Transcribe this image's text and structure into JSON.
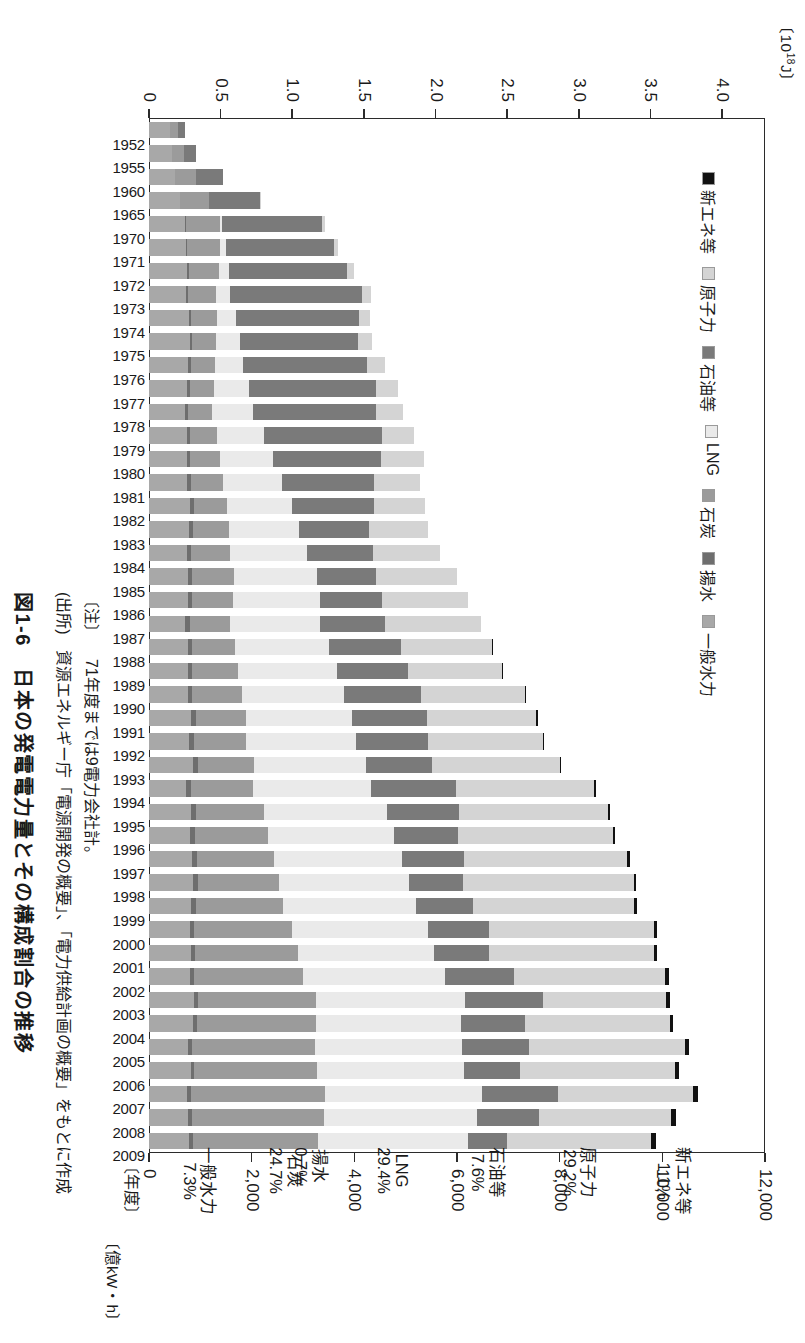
{
  "figure": {
    "title": "図1-6　日本の発電電力量とその構成割合の推移",
    "note_label": "〔注〕",
    "note_text": "71年度までは9電力会社計。",
    "source_label": "(出所)",
    "source_text": "資源エネルギー庁「電源開発の概要」、「電力供給計画の概要」をもとに作成",
    "xaxis_label": "〔年度〕"
  },
  "chart_data": {
    "type": "bar",
    "subtype": "stacked-horizontal",
    "title": "日本の発電電力量とその構成割合の推移",
    "xlabel": "〔年度〕",
    "ylabel_primary": "〔10¹⁸J〕",
    "ylabel_secondary": "〔億kW・h〕",
    "grid": false,
    "legend_position": "bottom-left",
    "primary_axis": {
      "unit": "10^18 J",
      "ticks": [
        "4.0",
        "3.5",
        "3.0",
        "2.5",
        "2.0",
        "1.5",
        "1.0",
        "0.5",
        "0"
      ],
      "range": [
        0,
        4.3
      ]
    },
    "secondary_axis": {
      "unit": "億kW・h",
      "ticks": [
        "12,000",
        "10,000",
        "8,000",
        "6,000",
        "4,000",
        "2,000",
        "0"
      ],
      "range": [
        0,
        12000
      ]
    },
    "categories": [
      "1952",
      "1955",
      "1960",
      "1965",
      "1970",
      "1971",
      "1972",
      "1973",
      "1974",
      "1975",
      "1976",
      "1977",
      "1978",
      "1979",
      "1980",
      "1981",
      "1982",
      "1983",
      "1984",
      "1985",
      "1986",
      "1987",
      "1988",
      "1989",
      "1990",
      "1991",
      "1992",
      "1993",
      "1994",
      "1995",
      "1996",
      "1997",
      "1998",
      "1999",
      "2000",
      "2001",
      "2002",
      "2003",
      "2004",
      "2005",
      "2006",
      "2007",
      "2008",
      "2009"
    ],
    "series": [
      {
        "name": "一般水力",
        "share_2009": "7.3%",
        "color": "#a8a8a8",
        "values": [
          408,
          452,
          500,
          600,
          700,
          720,
          740,
          720,
          770,
          790,
          760,
          740,
          700,
          740,
          740,
          750,
          800,
          780,
          740,
          760,
          760,
          710,
          760,
          760,
          760,
          820,
          780,
          860,
          730,
          820,
          800,
          840,
          860,
          820,
          800,
          810,
          800,
          880,
          850,
          760,
          810,
          740,
          760,
          780
        ]
      },
      {
        "name": "揚水",
        "share_2009": "0.7%",
        "color": "#6e6e6e",
        "values": [
          0,
          0,
          5,
          10,
          20,
          25,
          30,
          35,
          40,
          45,
          50,
          55,
          60,
          62,
          65,
          68,
          70,
          72,
          74,
          76,
          78,
          80,
          82,
          84,
          86,
          88,
          90,
          92,
          92,
          92,
          92,
          92,
          90,
          88,
          86,
          84,
          82,
          80,
          78,
          76,
          76,
          76,
          74,
          72
        ]
      },
      {
        "name": "石炭",
        "share_2009": "24.7%",
        "color": "#9b9b9b",
        "values": [
          160,
          240,
          420,
          560,
          660,
          640,
          600,
          560,
          520,
          480,
          470,
          470,
          470,
          520,
          580,
          620,
          650,
          700,
          760,
          820,
          800,
          790,
          830,
          890,
          960,
          990,
          1030,
          1100,
          1200,
          1320,
          1420,
          1500,
          1580,
          1700,
          1900,
          2000,
          2120,
          2300,
          2320,
          2400,
          2380,
          2620,
          2580,
          2450
        ]
      },
      {
        "name": "LNG",
        "share_2009": "29.4%",
        "color": "#eaeaea",
        "values": [
          0,
          0,
          0,
          0,
          50,
          110,
          190,
          270,
          360,
          460,
          560,
          680,
          800,
          920,
          1040,
          1150,
          1260,
          1380,
          1500,
          1620,
          1700,
          1760,
          1840,
          1920,
          2000,
          2060,
          2140,
          2180,
          2300,
          2400,
          2460,
          2500,
          2540,
          2600,
          2640,
          2660,
          2760,
          2900,
          2830,
          2860,
          2880,
          3060,
          2980,
          2920
        ]
      },
      {
        "name": "石油等",
        "share_2009": "7.6%",
        "color": "#7a7a7a",
        "values": [
          130,
          230,
          520,
          1000,
          1950,
          2100,
          2300,
          2560,
          2400,
          2300,
          2400,
          2480,
          2400,
          2300,
          2100,
          1800,
          1600,
          1350,
          1300,
          1150,
          1200,
          1250,
          1400,
          1400,
          1500,
          1450,
          1400,
          1280,
          1650,
          1400,
          1250,
          1200,
          1050,
          1100,
          1200,
          1080,
          1350,
          1520,
          1250,
          1300,
          1080,
          1470,
          1200,
          760
        ]
      },
      {
        "name": "原子力",
        "share_2009": "29.2%",
        "color": "#d4d4d4",
        "values": [
          0,
          0,
          0,
          10,
          45,
          80,
          140,
          180,
          220,
          280,
          360,
          420,
          520,
          620,
          830,
          900,
          1000,
          1150,
          1300,
          1580,
          1680,
          1870,
          1780,
          1830,
          2020,
          2140,
          2230,
          2490,
          2700,
          2910,
          3020,
          3190,
          3320,
          3150,
          3220,
          3200,
          2950,
          2400,
          2820,
          3050,
          3030,
          2640,
          2580,
          2800
        ]
      },
      {
        "name": "新エネ等",
        "share_2009": "1.1%",
        "color": "#111111",
        "values": [
          0,
          0,
          0,
          0,
          0,
          0,
          0,
          0,
          0,
          0,
          0,
          0,
          0,
          0,
          0,
          0,
          0,
          0,
          0,
          0,
          0,
          0,
          20,
          22,
          24,
          26,
          28,
          30,
          32,
          34,
          42,
          44,
          46,
          48,
          52,
          56,
          60,
          64,
          68,
          72,
          78,
          84,
          90,
          95
        ]
      }
    ],
    "callouts": [
      {
        "name": "新エネ等",
        "value": "1.1%"
      },
      {
        "name": "原子力",
        "value": "29.2%"
      },
      {
        "name": "石油等",
        "value": "7.6%"
      },
      {
        "name": "LNG",
        "value": "29.4%"
      },
      {
        "name": "石炭",
        "value": "24.7%"
      },
      {
        "name": "揚水",
        "value": "0.7%"
      },
      {
        "name": "一般水力",
        "value": "7.3%"
      }
    ],
    "legend": [
      {
        "label": "新エネ等",
        "color": "#111111"
      },
      {
        "label": "原子力",
        "color": "#d4d4d4"
      },
      {
        "label": "石油等",
        "color": "#7a7a7a"
      },
      {
        "label": "LNG",
        "color": "#eaeaea"
      },
      {
        "label": "石炭",
        "color": "#9b9b9b"
      },
      {
        "label": "揚水",
        "color": "#6e6e6e"
      },
      {
        "label": "一般水力",
        "color": "#a8a8a8"
      }
    ]
  }
}
